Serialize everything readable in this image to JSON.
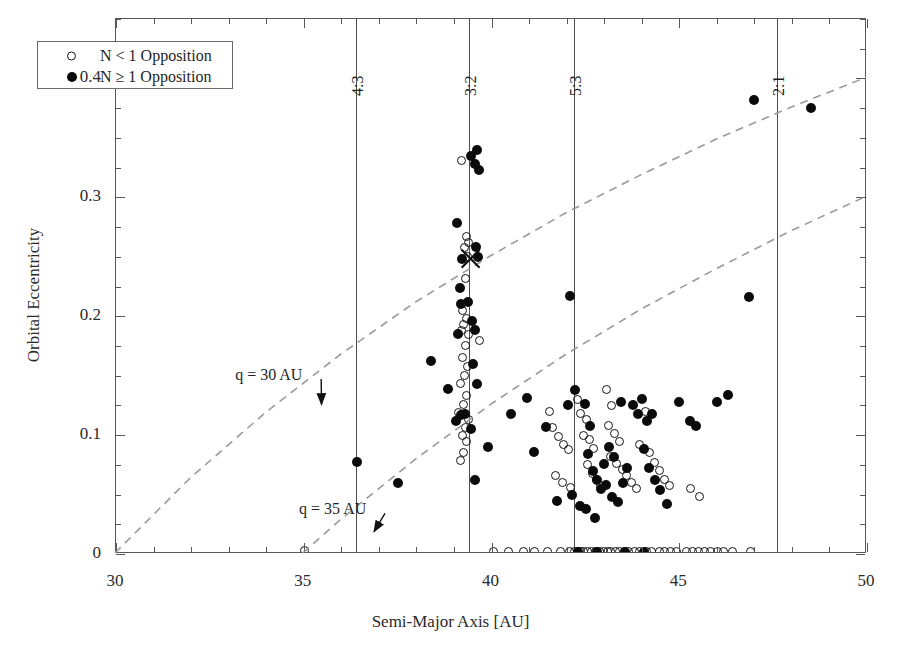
{
  "figure": {
    "background": "#ffffff",
    "marker_open_color": "#141414",
    "marker_filled_color": "#0b0b0b",
    "frame_color": "#58585a",
    "guide_color": "#9a9a9a"
  },
  "chart_data": {
    "type": "scatter",
    "title": "",
    "xlabel": "Semi-Major Axis [AU]",
    "ylabel": "Orbital Eccentricity",
    "xlim": [
      30,
      50
    ],
    "ylim": [
      0,
      0.45
    ],
    "xticks": [
      30,
      35,
      40,
      45,
      50
    ],
    "xtick_labels": [
      "30",
      "35",
      "40",
      "45",
      "50"
    ],
    "xtick_minor_step": 1,
    "yticks": [
      0,
      0.1,
      0.2,
      0.3,
      0.4
    ],
    "ytick_labels": [
      "0",
      "0.1",
      "0.2",
      "0.3",
      "0.4"
    ],
    "ytick_minor_step": 0.025,
    "grid": false,
    "legend_position": "upper-left",
    "legend": [
      {
        "marker": "open-circle",
        "label": "N < 1 Opposition"
      },
      {
        "marker": "filled-circle",
        "label": "N ≥ 1 Opposition"
      }
    ],
    "annotations": [
      {
        "text": "q = 30 AU",
        "x": 33.2,
        "y": 0.148,
        "arrow_to_x": 35.5,
        "arrow_to_y": 0.125
      },
      {
        "text": "q = 35 AU",
        "x": 34.9,
        "y": 0.035,
        "arrow_to_x": 36.9,
        "arrow_to_y": 0.018
      }
    ],
    "resonance_lines": [
      {
        "label": "4:3",
        "x": 36.4
      },
      {
        "label": "3:2",
        "x": 39.4
      },
      {
        "label": "5:3",
        "x": 42.2
      },
      {
        "label": "2:1",
        "x": 47.6
      }
    ],
    "guide_curves": [
      {
        "name": "q = 30 AU",
        "style": "dashed",
        "points": [
          [
            30.0,
            0.0
          ],
          [
            32.0,
            0.063
          ],
          [
            34.0,
            0.118
          ],
          [
            36.0,
            0.167
          ],
          [
            38.0,
            0.211
          ],
          [
            40.0,
            0.25
          ],
          [
            42.0,
            0.286
          ],
          [
            44.0,
            0.318
          ],
          [
            46.0,
            0.348
          ],
          [
            48.0,
            0.375
          ],
          [
            50.0,
            0.4
          ]
        ]
      },
      {
        "name": "q = 35 AU",
        "style": "dashed",
        "points": [
          [
            35.0,
            0.0
          ],
          [
            36.0,
            0.028
          ],
          [
            38.0,
            0.079
          ],
          [
            40.0,
            0.125
          ],
          [
            42.0,
            0.167
          ],
          [
            44.0,
            0.205
          ],
          [
            46.0,
            0.239
          ],
          [
            48.0,
            0.271
          ],
          [
            50.0,
            0.3
          ]
        ]
      }
    ],
    "special_markers": [
      {
        "marker": "cross",
        "x": 39.47,
        "y": 0.2475
      }
    ],
    "series": [
      {
        "name": "N < 1 Opposition",
        "marker": "open-circle",
        "points": [
          [
            35.02,
            0.003
          ],
          [
            39.21,
            0.331
          ],
          [
            39.33,
            0.267
          ],
          [
            39.4,
            0.262
          ],
          [
            39.28,
            0.258
          ],
          [
            39.36,
            0.25
          ],
          [
            39.3,
            0.232
          ],
          [
            39.22,
            0.205
          ],
          [
            39.34,
            0.198
          ],
          [
            39.26,
            0.193
          ],
          [
            39.19,
            0.188
          ],
          [
            39.38,
            0.185
          ],
          [
            39.69,
            0.18
          ],
          [
            39.31,
            0.175
          ],
          [
            39.24,
            0.165
          ],
          [
            39.35,
            0.158
          ],
          [
            39.27,
            0.15
          ],
          [
            39.17,
            0.143
          ],
          [
            39.33,
            0.133
          ],
          [
            39.25,
            0.126
          ],
          [
            39.12,
            0.119
          ],
          [
            39.4,
            0.113
          ],
          [
            39.3,
            0.106
          ],
          [
            39.22,
            0.1
          ],
          [
            39.34,
            0.095
          ],
          [
            39.26,
            0.085
          ],
          [
            39.18,
            0.079
          ],
          [
            41.55,
            0.12
          ],
          [
            41.62,
            0.106
          ],
          [
            41.78,
            0.099
          ],
          [
            41.92,
            0.092
          ],
          [
            42.05,
            0.088
          ],
          [
            41.7,
            0.066
          ],
          [
            41.88,
            0.06
          ],
          [
            42.1,
            0.056
          ],
          [
            42.3,
            0.13
          ],
          [
            42.38,
            0.118
          ],
          [
            42.52,
            0.113
          ],
          [
            42.46,
            0.1
          ],
          [
            42.6,
            0.096
          ],
          [
            42.72,
            0.089
          ],
          [
            42.55,
            0.075
          ],
          [
            42.68,
            0.068
          ],
          [
            42.8,
            0.063
          ],
          [
            42.9,
            0.058
          ],
          [
            43.05,
            0.138
          ],
          [
            43.2,
            0.125
          ],
          [
            43.12,
            0.108
          ],
          [
            43.28,
            0.101
          ],
          [
            43.4,
            0.095
          ],
          [
            43.18,
            0.082
          ],
          [
            43.33,
            0.076
          ],
          [
            43.48,
            0.071
          ],
          [
            43.6,
            0.066
          ],
          [
            43.72,
            0.06
          ],
          [
            43.85,
            0.055
          ],
          [
            43.95,
            0.092
          ],
          [
            44.1,
            0.12
          ],
          [
            44.22,
            0.085
          ],
          [
            44.35,
            0.077
          ],
          [
            44.48,
            0.07
          ],
          [
            44.6,
            0.063
          ],
          [
            44.75,
            0.058
          ],
          [
            45.3,
            0.055
          ],
          [
            45.55,
            0.048
          ],
          [
            41.5,
            0.002
          ],
          [
            41.85,
            0.002
          ],
          [
            42.08,
            0.002
          ],
          [
            42.2,
            0.002
          ],
          [
            42.28,
            0.002
          ],
          [
            42.36,
            0.002
          ],
          [
            42.45,
            0.002
          ],
          [
            42.56,
            0.002
          ],
          [
            42.66,
            0.002
          ],
          [
            42.76,
            0.002
          ],
          [
            42.88,
            0.002
          ],
          [
            42.98,
            0.002
          ],
          [
            43.08,
            0.002
          ],
          [
            43.18,
            0.002
          ],
          [
            43.3,
            0.002
          ],
          [
            43.42,
            0.002
          ],
          [
            43.54,
            0.002
          ],
          [
            43.66,
            0.002
          ],
          [
            43.8,
            0.002
          ],
          [
            43.95,
            0.002
          ],
          [
            44.12,
            0.002
          ],
          [
            44.26,
            0.002
          ],
          [
            44.48,
            0.002
          ],
          [
            44.62,
            0.002
          ],
          [
            44.78,
            0.002
          ],
          [
            44.92,
            0.002
          ],
          [
            45.18,
            0.002
          ],
          [
            45.34,
            0.002
          ],
          [
            45.5,
            0.002
          ],
          [
            45.66,
            0.002
          ],
          [
            45.84,
            0.002
          ],
          [
            46.02,
            0.002
          ],
          [
            46.18,
            0.002
          ],
          [
            46.42,
            0.002
          ],
          [
            46.9,
            0.002
          ],
          [
            40.05,
            0.002
          ],
          [
            40.45,
            0.002
          ],
          [
            40.85,
            0.002
          ],
          [
            41.15,
            0.002
          ]
        ]
      },
      {
        "name": "N ≥ 1 Opposition",
        "marker": "filled-circle",
        "points": [
          [
            36.42,
            0.077
          ],
          [
            37.52,
            0.06
          ],
          [
            38.38,
            0.162
          ],
          [
            39.62,
            0.34
          ],
          [
            39.55,
            0.328
          ],
          [
            39.68,
            0.323
          ],
          [
            39.45,
            0.335
          ],
          [
            39.08,
            0.278
          ],
          [
            39.22,
            0.248
          ],
          [
            39.58,
            0.258
          ],
          [
            39.63,
            0.25
          ],
          [
            39.15,
            0.224
          ],
          [
            39.38,
            0.212
          ],
          [
            39.18,
            0.21
          ],
          [
            39.48,
            0.196
          ],
          [
            39.56,
            0.188
          ],
          [
            39.1,
            0.185
          ],
          [
            39.52,
            0.16
          ],
          [
            39.62,
            0.143
          ],
          [
            38.85,
            0.139
          ],
          [
            39.3,
            0.118
          ],
          [
            39.2,
            0.117
          ],
          [
            39.05,
            0.112
          ],
          [
            39.46,
            0.105
          ],
          [
            39.9,
            0.09
          ],
          [
            39.55,
            0.062
          ],
          [
            40.95,
            0.131
          ],
          [
            40.52,
            0.118
          ],
          [
            41.45,
            0.107
          ],
          [
            41.12,
            0.086
          ],
          [
            42.1,
            0.217
          ],
          [
            42.22,
            0.138
          ],
          [
            42.15,
            0.05
          ],
          [
            42.35,
            0.04
          ],
          [
            41.75,
            0.045
          ],
          [
            42.05,
            0.125
          ],
          [
            42.48,
            0.126
          ],
          [
            42.62,
            0.108
          ],
          [
            42.58,
            0.084
          ],
          [
            42.7,
            0.07
          ],
          [
            42.8,
            0.062
          ],
          [
            42.92,
            0.055
          ],
          [
            42.52,
            0.038
          ],
          [
            42.75,
            0.03
          ],
          [
            43.0,
            0.076
          ],
          [
            43.12,
            0.09
          ],
          [
            43.25,
            0.082
          ],
          [
            43.05,
            0.058
          ],
          [
            43.22,
            0.048
          ],
          [
            43.38,
            0.044
          ],
          [
            43.5,
            0.06
          ],
          [
            43.62,
            0.072
          ],
          [
            43.45,
            0.128
          ],
          [
            43.78,
            0.125
          ],
          [
            43.9,
            0.118
          ],
          [
            44.02,
            0.13
          ],
          [
            44.15,
            0.112
          ],
          [
            44.28,
            0.118
          ],
          [
            44.05,
            0.088
          ],
          [
            44.2,
            0.072
          ],
          [
            44.35,
            0.062
          ],
          [
            44.5,
            0.054
          ],
          [
            44.68,
            0.042
          ],
          [
            45.0,
            0.128
          ],
          [
            45.28,
            0.112
          ],
          [
            45.45,
            0.108
          ],
          [
            46.0,
            0.128
          ],
          [
            46.3,
            0.134
          ],
          [
            46.85,
            0.216
          ],
          [
            47.0,
            0.382
          ],
          [
            48.5,
            0.375
          ],
          [
            42.3,
            0.002
          ],
          [
            42.8,
            0.002
          ],
          [
            43.55,
            0.002
          ],
          [
            44.05,
            0.002
          ]
        ]
      }
    ]
  }
}
